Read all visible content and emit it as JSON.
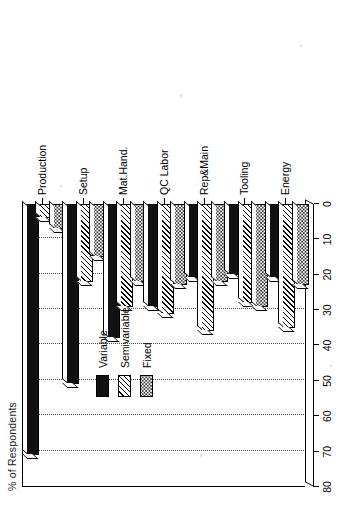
{
  "chart_data": {
    "type": "bar",
    "orientation": "horizontal-rotated",
    "title": "",
    "xlabel": "",
    "ylabel": "% of Respondents",
    "categories": [
      "Production",
      "Setup",
      "Mat.Hand.",
      "QC Labor",
      "Rep&Main",
      "Tooling",
      "Energy"
    ],
    "tick_labels": [
      "80",
      "70",
      "60",
      "50",
      "40",
      "30",
      "20",
      "10",
      "0"
    ],
    "ylim": [
      0,
      80
    ],
    "grid": true,
    "legend_position": "upper-center",
    "series": [
      {
        "name": "Variable",
        "pattern": "solid-black",
        "values": [
          71,
          51,
          38,
          29,
          21,
          20,
          21
        ]
      },
      {
        "name": "Semivariable",
        "pattern": "diagonal-hatch",
        "values": [
          4,
          22,
          29,
          31,
          36,
          28,
          35
        ]
      },
      {
        "name": "Fixed",
        "pattern": "dotted-light",
        "values": [
          7,
          15,
          22,
          23,
          22,
          29,
          23
        ]
      }
    ]
  },
  "legend": {
    "items": [
      {
        "label": "Variable"
      },
      {
        "label": "Semivariable"
      },
      {
        "label": "Fixed"
      }
    ]
  },
  "colors": {
    "variable": "#111111",
    "semivariable": "#000000",
    "fixed": "#3a3a3a",
    "axis": "#000000",
    "grid": "#4a4a4a",
    "background": "#ffffff"
  }
}
